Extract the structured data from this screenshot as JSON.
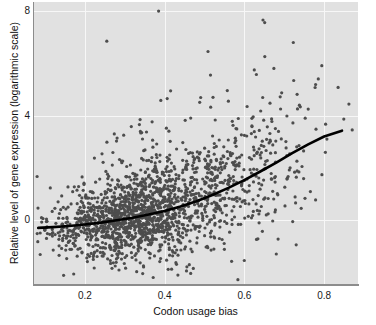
{
  "chart_data": {
    "type": "scatter",
    "title": "",
    "subtitle": "",
    "xlabel": "Codon usage bias",
    "ylabel": "Relative level of gene expression (logarithmic scale)",
    "xlim": [
      0.07,
      0.885
    ],
    "ylim": [
      -2.45,
      8.35
    ],
    "xticks": [
      0.2,
      0.4,
      0.6,
      0.8
    ],
    "xticklabels": [
      "0.2",
      "0.4",
      "0.6",
      "0.8"
    ],
    "yticks": [
      0,
      4,
      8
    ],
    "yticklabels": [
      "0",
      "4",
      "8"
    ],
    "grid": true,
    "grid_color": "#f7f7f7",
    "panel_color": "#e1e1e1",
    "legend": null,
    "point_color": "#4d4d4d",
    "point_size": 1.6,
    "point_count": 1850,
    "series": [
      {
        "name": "genes",
        "type": "scatter",
        "description": "Each point is one gene: codon usage bias vs log relative expression level",
        "x_mean": 0.375,
        "y_mean": 0.55,
        "notes": "Dense cloud centred near x=0.30-0.45, y=-0.3 to 1.2; spread widens upward with increasing codon bias; sparse high outliers up to y=8.0"
      },
      {
        "name": "loess-fit",
        "type": "line",
        "color": "#000000",
        "width": 2.6,
        "description": "Smoothed (LOESS) trend line, flat then rising",
        "points": [
          [
            0.083,
            -0.3
          ],
          [
            0.12,
            -0.27
          ],
          [
            0.16,
            -0.23
          ],
          [
            0.2,
            -0.17
          ],
          [
            0.24,
            -0.1
          ],
          [
            0.28,
            -0.01
          ],
          [
            0.32,
            0.09
          ],
          [
            0.36,
            0.21
          ],
          [
            0.4,
            0.35
          ],
          [
            0.44,
            0.52
          ],
          [
            0.48,
            0.72
          ],
          [
            0.52,
            0.96
          ],
          [
            0.56,
            1.23
          ],
          [
            0.6,
            1.53
          ],
          [
            0.64,
            1.86
          ],
          [
            0.68,
            2.2
          ],
          [
            0.72,
            2.56
          ],
          [
            0.76,
            2.9
          ],
          [
            0.8,
            3.2
          ],
          [
            0.845,
            3.42
          ]
        ]
      }
    ]
  },
  "axes": {
    "y_ticks": [
      {
        "value": 8,
        "label": "8"
      },
      {
        "value": 4,
        "label": "4"
      },
      {
        "value": 0,
        "label": "0"
      }
    ],
    "x_ticks": [
      {
        "value": 0.2,
        "label": "0.2"
      },
      {
        "value": 0.4,
        "label": "0.4"
      },
      {
        "value": 0.6,
        "label": "0.6"
      },
      {
        "value": 0.8,
        "label": "0.8"
      }
    ],
    "x_title": "Codon usage bias",
    "y_title": "Relative level of gene expression (logarithmic scale)"
  }
}
